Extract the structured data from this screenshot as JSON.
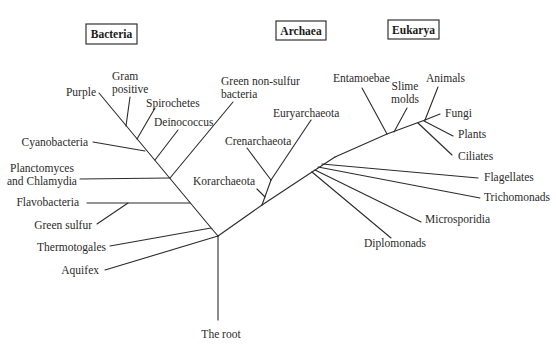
{
  "domains": [
    {
      "id": "bacteria",
      "label": "Bacteria",
      "box": [
        86,
        24,
        51,
        20
      ]
    },
    {
      "id": "archaea",
      "label": "Archaea",
      "box": [
        276,
        21,
        50,
        19
      ]
    },
    {
      "id": "eukarya",
      "label": "Eukarya",
      "box": [
        388,
        20,
        51,
        19
      ]
    }
  ],
  "root": {
    "label": "The root"
  },
  "taxa": {
    "bacteria": [
      {
        "id": "purple",
        "lines": [
          "Purple"
        ]
      },
      {
        "id": "gram-positive",
        "lines": [
          "Gram",
          "positive"
        ]
      },
      {
        "id": "spirochetes",
        "lines": [
          "Spirochetes"
        ]
      },
      {
        "id": "deinococcus",
        "lines": [
          "Deinococcus"
        ]
      },
      {
        "id": "green-non-sulfur",
        "lines": [
          "Green non-sulfur",
          "bacteria"
        ]
      },
      {
        "id": "cyanobacteria",
        "lines": [
          "Cyanobacteria"
        ]
      },
      {
        "id": "planctomyces",
        "lines": [
          "Planctomyces",
          "and Chlamydia"
        ]
      },
      {
        "id": "flavobacteria",
        "lines": [
          "Flavobacteria"
        ]
      },
      {
        "id": "green-sulfur",
        "lines": [
          "Green sulfur"
        ]
      },
      {
        "id": "thermotogales",
        "lines": [
          "Thermotogales"
        ]
      },
      {
        "id": "aquifex",
        "lines": [
          "Aquifex"
        ]
      }
    ],
    "archaea": [
      {
        "id": "euryarchaeota",
        "lines": [
          "Euryarchaeota"
        ]
      },
      {
        "id": "crenarchaeota",
        "lines": [
          "Crenarchaeota"
        ]
      },
      {
        "id": "korarchaeota",
        "lines": [
          "Korarchaeota"
        ]
      }
    ],
    "eukarya": [
      {
        "id": "entamoebae",
        "lines": [
          "Entamoebae"
        ]
      },
      {
        "id": "slime-molds",
        "lines": [
          "Slime",
          "molds"
        ]
      },
      {
        "id": "animals",
        "lines": [
          "Animals"
        ]
      },
      {
        "id": "fungi",
        "lines": [
          "Fungi"
        ]
      },
      {
        "id": "plants",
        "lines": [
          "Plants"
        ]
      },
      {
        "id": "ciliates",
        "lines": [
          "Ciliates"
        ]
      },
      {
        "id": "flagellates",
        "lines": [
          "Flagellates"
        ]
      },
      {
        "id": "trichomonads",
        "lines": [
          "Trichomonads"
        ]
      },
      {
        "id": "microsporidia",
        "lines": [
          "Microsporidia"
        ]
      },
      {
        "id": "diplomonads",
        "lines": [
          "Diplomonads"
        ]
      }
    ]
  }
}
